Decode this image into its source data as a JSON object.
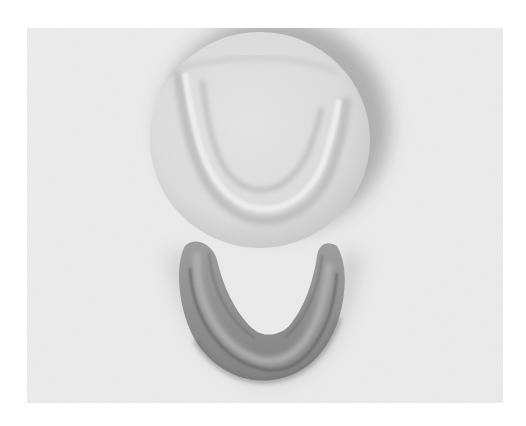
{
  "image": {
    "kind": "photograph",
    "mode": "grayscale",
    "alt": "Grayscale photograph of a round plaster dental impression (top) and a horseshoe-shaped mandibular model (bottom) on a light background",
    "subjects": [
      {
        "name": "round-plaster-impression",
        "shape": "circle",
        "tone": "light gray"
      },
      {
        "name": "horseshoe-mandibular-model",
        "shape": "U-shape",
        "tone": "mid gray"
      }
    ]
  },
  "colors": {
    "page_background": "#ffffff",
    "photo_background": "#ececec",
    "plaster": "#dedede",
    "plaster_ridge": "#c4c4c4",
    "shadow": "#a9a9a9",
    "model": "#8e8e8e",
    "model_dark": "#5e5e5e",
    "model_light": "#b3b3b3"
  }
}
